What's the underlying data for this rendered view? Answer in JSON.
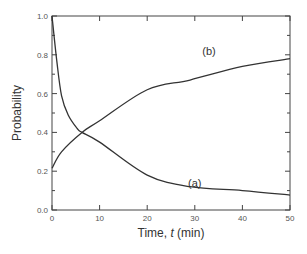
{
  "chart_data": {
    "type": "line",
    "title": "",
    "xlabel": "Time, t (min)",
    "xlabel_parts": {
      "prefix": "Time, ",
      "italic": "t",
      "suffix": " (min)"
    },
    "ylabel": "Probability",
    "xlim": [
      0,
      50
    ],
    "ylim": [
      0,
      1.0
    ],
    "xticks": [
      0,
      10,
      20,
      30,
      40,
      50
    ],
    "xtick_labels": [
      "0",
      "10",
      "20",
      "30",
      "40",
      "50"
    ],
    "yticks": [
      0.0,
      0.2,
      0.4,
      0.6,
      0.8,
      1.0
    ],
    "ytick_labels": [
      "0.0",
      "0.2",
      "0.4",
      "0.6",
      "0.8",
      "1.0"
    ],
    "yminor_ticks": [
      0.1,
      0.3,
      0.5,
      0.7,
      0.9
    ],
    "grid": false,
    "legend": "none (curves labeled inline)",
    "series": [
      {
        "name": "(a)",
        "label_position": {
          "x": 30,
          "y": 0.14
        },
        "x": [
          0,
          1,
          2,
          3.4,
          5.3,
          6.3,
          10,
          20,
          29,
          40,
          50
        ],
        "y": [
          1.0,
          0.77,
          0.59,
          0.49,
          0.42,
          0.4,
          0.35,
          0.18,
          0.12,
          0.1,
          0.077
        ]
      },
      {
        "name": "(b)",
        "label_position": {
          "x": 33,
          "y": 0.82
        },
        "x": [
          0,
          2,
          6.3,
          10,
          20,
          29,
          40,
          50
        ],
        "y": [
          0.215,
          0.3,
          0.4,
          0.46,
          0.62,
          0.67,
          0.74,
          0.78
        ]
      }
    ]
  },
  "colors": {
    "curve": "#333333",
    "axis": "#444444",
    "background": "#ffffff"
  }
}
